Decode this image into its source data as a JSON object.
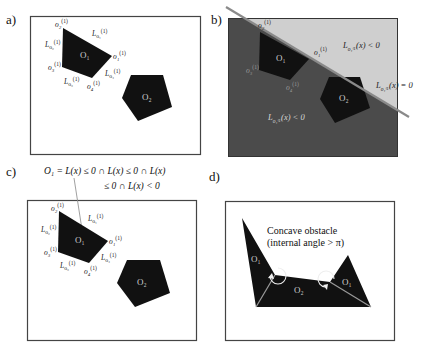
{
  "panels": {
    "a": {
      "label": "a)",
      "obstacles": [
        "O₁",
        "O₂"
      ],
      "vertices": [
        "o₁",
        "o₂",
        "o₃",
        "o₄"
      ],
      "vertex_superscript": "(1)",
      "edges": [
        "L",
        "L",
        "L",
        "L"
      ],
      "edge_subscripts": [
        "o₁",
        "o₂",
        "o₃",
        "o₄"
      ]
    },
    "b": {
      "label": "b)",
      "obstacles": [
        "O₁",
        "O₂"
      ],
      "vertex_labels": [
        "o₂",
        "o₁",
        "o₃",
        "o₄"
      ],
      "vertex_superscript": "(1)",
      "region_upper": "(x) < 0",
      "region_lower": "(x) < 0",
      "boundary": "(x) = 0",
      "colors": {
        "upper_region": "#cfcfcf",
        "lower_region": "#4b4b4b",
        "line": "#8a8a8a"
      }
    },
    "c": {
      "label": "c)",
      "equation_line1": "O₁ = L(x) ≤ 0 ∩ L(x) ≤ 0 ∩ L(x)",
      "equation_line2": "≤ 0 ∩ L(x) < 0",
      "obstacles": [
        "O₁",
        "O₂"
      ],
      "vertices": [
        "o₁",
        "o₂",
        "o₃",
        "o₄"
      ],
      "vertex_superscript": "(1)"
    },
    "d": {
      "label": "d)",
      "note_line1": "Concave obstacle",
      "note_line2": "(internal angle > π)",
      "obstacles": [
        "O₁",
        "O₂",
        "O₁"
      ]
    }
  },
  "colors": {
    "obstacle_fill": "#111111",
    "frame": "#444444",
    "background": "#ffffff"
  }
}
